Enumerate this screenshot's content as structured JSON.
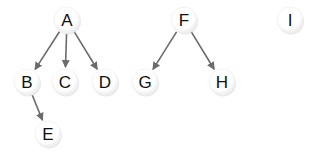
{
  "diagram": {
    "type": "forest",
    "nodes": [
      {
        "id": "A",
        "label": "A",
        "x": 67,
        "y": 20
      },
      {
        "id": "B",
        "label": "B",
        "x": 27,
        "y": 82
      },
      {
        "id": "C",
        "label": "C",
        "x": 65,
        "y": 82
      },
      {
        "id": "D",
        "label": "D",
        "x": 105,
        "y": 82
      },
      {
        "id": "E",
        "label": "E",
        "x": 48,
        "y": 134
      },
      {
        "id": "F",
        "label": "F",
        "x": 184,
        "y": 20
      },
      {
        "id": "G",
        "label": "G",
        "x": 145,
        "y": 82
      },
      {
        "id": "H",
        "label": "H",
        "x": 222,
        "y": 82
      },
      {
        "id": "I",
        "label": "I",
        "x": 290,
        "y": 20
      }
    ],
    "edges": [
      {
        "from": "A",
        "to": "B"
      },
      {
        "from": "A",
        "to": "C"
      },
      {
        "from": "A",
        "to": "D"
      },
      {
        "from": "B",
        "to": "E"
      },
      {
        "from": "F",
        "to": "G"
      },
      {
        "from": "F",
        "to": "H"
      }
    ],
    "colors": {
      "edge": "#6b6b6b",
      "node_fill": "#ffffff",
      "node_shadow": "#d9d9d9",
      "label": "#111111"
    },
    "node_radius": 13
  }
}
